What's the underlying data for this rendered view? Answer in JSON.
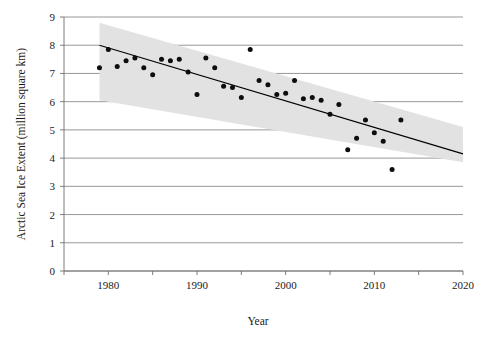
{
  "chart_data": {
    "type": "scatter",
    "title": "",
    "xlabel": "Year",
    "ylabel": "Arctic Sea Ice Extent (million square km)",
    "xlim": [
      1975,
      2020
    ],
    "ylim": [
      0,
      9
    ],
    "xticks": [
      1980,
      1990,
      2000,
      2010,
      2020
    ],
    "xtick_labels": [
      "1980",
      "1990",
      "2000",
      "2010",
      "2020"
    ],
    "xminor_ticks": [
      1975,
      1985,
      1995,
      2005,
      2015
    ],
    "yticks": [
      0,
      1,
      2,
      3,
      4,
      5,
      6,
      7,
      8,
      9
    ],
    "ytick_labels": [
      "0",
      "1",
      "2",
      "3",
      "4",
      "5",
      "6",
      "7",
      "8",
      "9"
    ],
    "grid": "horizontal",
    "legend": "none",
    "x": [
      1979,
      1980,
      1981,
      1982,
      1983,
      1984,
      1985,
      1986,
      1987,
      1988,
      1989,
      1990,
      1991,
      1992,
      1993,
      1994,
      1995,
      1996,
      1997,
      1998,
      1999,
      2000,
      2001,
      2002,
      2003,
      2004,
      2005,
      2006,
      2007,
      2008,
      2009,
      2010,
      2011,
      2012,
      2013
    ],
    "values": [
      7.2,
      7.85,
      7.25,
      7.45,
      7.55,
      7.2,
      6.95,
      7.5,
      7.45,
      7.5,
      7.05,
      6.25,
      7.55,
      7.2,
      6.55,
      6.5,
      6.15,
      7.85,
      6.75,
      6.6,
      6.25,
      6.3,
      6.75,
      6.1,
      6.15,
      6.05,
      5.55,
      5.9,
      4.3,
      4.7,
      5.35,
      4.9,
      4.6,
      3.6,
      5.35
    ],
    "trend": {
      "label": "linear-trend",
      "x_start": 1979,
      "x_end": 2020,
      "y_start": 8.0,
      "y_end": 4.15
    },
    "confidence_band": {
      "label": "confidence-interval",
      "x_start": 1979,
      "x_end": 2020,
      "upper_start": 8.8,
      "upper_end": 5.1,
      "lower_start": 6.05,
      "lower_end": 3.85,
      "color": "#e2e2e2"
    },
    "colors": {
      "point": "#0d0d0d",
      "trend": "#000000",
      "grid": "#8c8c8c",
      "band": "#e2e2e2",
      "background": "#ffffff"
    }
  }
}
